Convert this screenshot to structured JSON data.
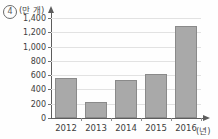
{
  "choice": {
    "marker": "4"
  },
  "chart_data": {
    "type": "bar",
    "title": "",
    "subtitle": "",
    "xlabel": "(년)",
    "ylabel": "(만 개)",
    "categories": [
      "2012",
      "2013",
      "2014",
      "2015",
      "2016"
    ],
    "values": [
      560,
      230,
      530,
      615,
      1290
    ],
    "series": [
      {
        "name": "",
        "values": [
          560,
          230,
          530,
          615,
          1290
        ]
      }
    ],
    "ylim": [
      0,
      1400
    ],
    "ytick_labels": [
      "0",
      "200",
      "400",
      "600",
      "800",
      "1,000",
      "1,200",
      "1,400"
    ],
    "ytick_values": [
      0,
      200,
      400,
      600,
      800,
      1000,
      1200,
      1400
    ],
    "grid": true,
    "legend": false,
    "legend_position": "none",
    "bar_color": "#a9a9a9",
    "bar_border_color": "#8a8a8a",
    "axis_color": "#5d5d5d",
    "gridline_color": "#e2e2e2"
  }
}
